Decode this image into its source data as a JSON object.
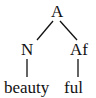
{
  "tree": {
    "root": {
      "label": "A"
    },
    "children": [
      {
        "label": "N",
        "leaf": "beauty"
      },
      {
        "label": "Af",
        "leaf": "ful"
      }
    ]
  }
}
